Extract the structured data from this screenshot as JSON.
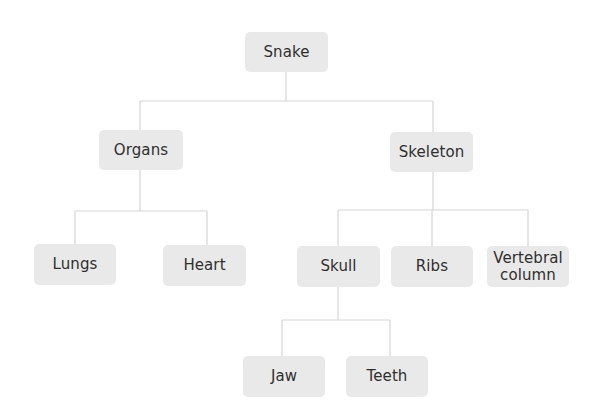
{
  "diagram": {
    "type": "tree",
    "colors": {
      "node_fill": "#e9e9e9",
      "node_text": "#2f2f2f",
      "connector": "#d6d6d6",
      "background": "#ffffff"
    },
    "nodes": {
      "snake": {
        "label": "Snake"
      },
      "organs": {
        "label": "Organs"
      },
      "skeleton": {
        "label": "Skeleton"
      },
      "lungs": {
        "label": "Lungs"
      },
      "heart": {
        "label": "Heart"
      },
      "skull": {
        "label": "Skull"
      },
      "ribs": {
        "label": "Ribs"
      },
      "vertebral": {
        "label_line1": "Vertebral",
        "label_line2": "column"
      },
      "jaw": {
        "label": "Jaw"
      },
      "teeth": {
        "label": "Teeth"
      }
    },
    "edges": [
      [
        "Snake",
        "Organs"
      ],
      [
        "Snake",
        "Skeleton"
      ],
      [
        "Organs",
        "Lungs"
      ],
      [
        "Organs",
        "Heart"
      ],
      [
        "Skeleton",
        "Skull"
      ],
      [
        "Skeleton",
        "Ribs"
      ],
      [
        "Skeleton",
        "Vertebral column"
      ],
      [
        "Skull",
        "Jaw"
      ],
      [
        "Skull",
        "Teeth"
      ]
    ]
  }
}
